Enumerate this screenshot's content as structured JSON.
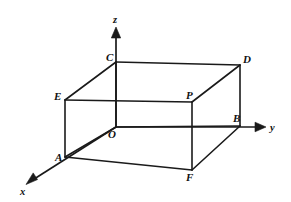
{
  "figure": {
    "type": "geometry-diagram",
    "canvas": {
      "width": 291,
      "height": 202,
      "background": "#ffffff"
    },
    "stroke_color": "#1a1a1a"
  },
  "axes": [
    {
      "name": "x",
      "label": "x",
      "label_x": 20,
      "label_y": 186,
      "from": [
        116,
        127
      ],
      "to": [
        26,
        184
      ],
      "arrow": true
    },
    {
      "name": "y",
      "label": "y",
      "label_x": 270,
      "label_y": 122,
      "from": [
        116,
        127
      ],
      "to": [
        266,
        127
      ],
      "arrow": true
    },
    {
      "name": "z",
      "label": "z",
      "label_x": 113,
      "label_y": 14,
      "from": [
        116,
        127
      ],
      "to": [
        116,
        27
      ],
      "arrow": true
    }
  ],
  "vertices": [
    {
      "id": "O",
      "label": "O",
      "x": 116,
      "y": 127,
      "label_x": 108,
      "label_y": 129
    },
    {
      "id": "A",
      "label": "A",
      "x": 65,
      "y": 157,
      "label_x": 55,
      "label_y": 152
    },
    {
      "id": "B",
      "label": "B",
      "x": 240,
      "y": 126,
      "label_x": 233,
      "label_y": 113
    },
    {
      "id": "C",
      "label": "C",
      "x": 116,
      "y": 62,
      "label_x": 106,
      "label_y": 52
    },
    {
      "id": "D",
      "label": "D",
      "x": 240,
      "y": 65,
      "label_x": 243,
      "label_y": 54
    },
    {
      "id": "E",
      "label": "E",
      "x": 65,
      "y": 100,
      "label_x": 54,
      "label_y": 91
    },
    {
      "id": "F",
      "label": "F",
      "x": 192,
      "y": 170,
      "label_x": 186,
      "label_y": 172
    },
    {
      "id": "P",
      "label": "P",
      "x": 192,
      "y": 102,
      "label_x": 186,
      "label_y": 90
    }
  ],
  "edges": [
    {
      "name": "edge-C-D",
      "from": [
        116,
        62
      ],
      "to": [
        240,
        65
      ]
    },
    {
      "name": "edge-C-E",
      "from": [
        116,
        62
      ],
      "to": [
        65,
        100
      ]
    },
    {
      "name": "edge-E-P",
      "from": [
        65,
        100
      ],
      "to": [
        192,
        102
      ]
    },
    {
      "name": "edge-P-D",
      "from": [
        192,
        102
      ],
      "to": [
        240,
        65
      ]
    },
    {
      "name": "edge-C-O",
      "from": [
        116,
        62
      ],
      "to": [
        116,
        127
      ]
    },
    {
      "name": "edge-D-B",
      "from": [
        240,
        65
      ],
      "to": [
        240,
        126
      ]
    },
    {
      "name": "edge-E-A",
      "from": [
        65,
        100
      ],
      "to": [
        65,
        157
      ]
    },
    {
      "name": "edge-P-F",
      "from": [
        192,
        102
      ],
      "to": [
        192,
        170
      ]
    },
    {
      "name": "edge-O-B",
      "from": [
        116,
        127
      ],
      "to": [
        240,
        126
      ]
    },
    {
      "name": "edge-A-O",
      "from": [
        65,
        157
      ],
      "to": [
        116,
        127
      ]
    },
    {
      "name": "edge-A-F",
      "from": [
        65,
        157
      ],
      "to": [
        192,
        170
      ]
    },
    {
      "name": "edge-F-B",
      "from": [
        192,
        170
      ],
      "to": [
        240,
        126
      ]
    }
  ]
}
